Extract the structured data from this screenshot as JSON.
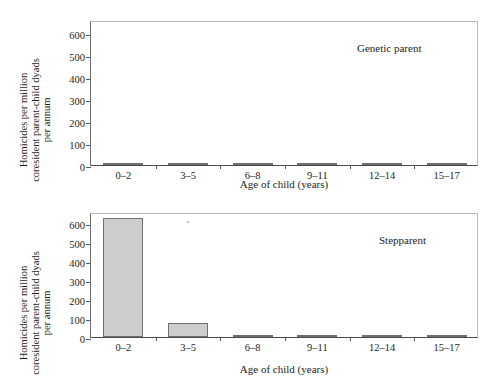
{
  "figure": {
    "ylabel_lines": [
      "Homicides per million",
      "coresident parent-child dyads",
      "per annum"
    ],
    "xlabel": "Age of child (years)",
    "categories": [
      "0–2",
      "3–5",
      "6–8",
      "9–11",
      "12–14",
      "15–17"
    ],
    "yticks": [
      "0",
      "100",
      "200",
      "300",
      "400",
      "500",
      "600"
    ],
    "bar_color": "#cdcdcd",
    "bar_border_color": "#6f6f6f",
    "axis_color": "#4a4a4a"
  },
  "panels": [
    {
      "id": "genetic",
      "note": "Genetic parent"
    },
    {
      "id": "step",
      "note": "Stepparent"
    }
  ],
  "chart_data": [
    {
      "type": "bar",
      "title": "Genetic parent",
      "categories": [
        "0–2",
        "3–5",
        "6–8",
        "9–11",
        "12–14",
        "15–17"
      ],
      "values": [
        7,
        2,
        1,
        1,
        1,
        1
      ],
      "xlabel": "Age of child (years)",
      "ylabel": "Homicides per million coresident parent-child dyads per annum",
      "ylim": [
        0,
        660
      ],
      "yticks": [
        0,
        100,
        200,
        300,
        400,
        500,
        600
      ],
      "grid": false,
      "legend": "none"
    },
    {
      "type": "bar",
      "title": "Stepparent",
      "categories": [
        "0–2",
        "3–5",
        "6–8",
        "9–11",
        "12–14",
        "15–17"
      ],
      "values": [
        630,
        75,
        8,
        5,
        5,
        4
      ],
      "xlabel": "Age of child (years)",
      "ylabel": "Homicides per million coresident parent-child dyads per annum",
      "ylim": [
        0,
        660
      ],
      "yticks": [
        0,
        100,
        200,
        300,
        400,
        500,
        600
      ],
      "grid": false,
      "legend": "none"
    }
  ]
}
